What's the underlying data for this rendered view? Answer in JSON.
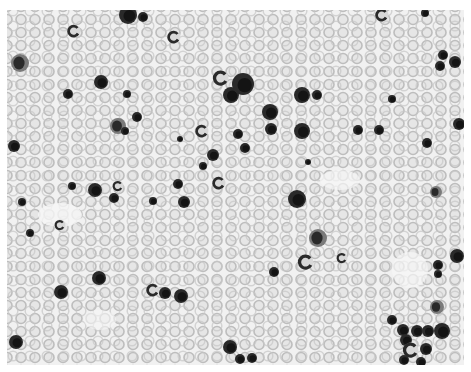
{
  "image": {
    "subject": "blood smear micrograph",
    "palette": {
      "background": "#f1f1f1",
      "rbc_ring": "#bdbdbd",
      "rbc_fill": "#e4e4e4",
      "nucleus": "#2a2a2a",
      "nucleus_dark": "#141414",
      "cytoplasm": "#7a7a7a",
      "border": "#ffffff"
    },
    "nucleated_cells": [
      {
        "x": 128,
        "y": 15,
        "r": 9
      },
      {
        "x": 143,
        "y": 17,
        "r": 5
      },
      {
        "x": 74,
        "y": 31,
        "r": 5,
        "type": "seg"
      },
      {
        "x": 174,
        "y": 37,
        "r": 5,
        "type": "seg"
      },
      {
        "x": 382,
        "y": 15,
        "r": 5,
        "type": "seg"
      },
      {
        "x": 425,
        "y": 13,
        "r": 4
      },
      {
        "x": 20,
        "y": 63,
        "r": 8,
        "type": "mono"
      },
      {
        "x": 101,
        "y": 82,
        "r": 7
      },
      {
        "x": 68,
        "y": 94,
        "r": 5
      },
      {
        "x": 127,
        "y": 94,
        "r": 4
      },
      {
        "x": 137,
        "y": 117,
        "r": 5
      },
      {
        "x": 118,
        "y": 126,
        "r": 7,
        "type": "mono"
      },
      {
        "x": 125,
        "y": 131,
        "r": 4
      },
      {
        "x": 14,
        "y": 146,
        "r": 6
      },
      {
        "x": 180,
        "y": 139,
        "r": 3
      },
      {
        "x": 221,
        "y": 78,
        "r": 6,
        "type": "seg"
      },
      {
        "x": 231,
        "y": 95,
        "r": 8
      },
      {
        "x": 243,
        "y": 84,
        "r": 11
      },
      {
        "x": 270,
        "y": 112,
        "r": 8
      },
      {
        "x": 271,
        "y": 129,
        "r": 6
      },
      {
        "x": 202,
        "y": 131,
        "r": 5,
        "type": "seg"
      },
      {
        "x": 238,
        "y": 134,
        "r": 5
      },
      {
        "x": 245,
        "y": 148,
        "r": 5
      },
      {
        "x": 213,
        "y": 155,
        "r": 6
      },
      {
        "x": 203,
        "y": 166,
        "r": 4
      },
      {
        "x": 302,
        "y": 95,
        "r": 8
      },
      {
        "x": 317,
        "y": 95,
        "r": 5
      },
      {
        "x": 302,
        "y": 131,
        "r": 8
      },
      {
        "x": 308,
        "y": 162,
        "r": 3
      },
      {
        "x": 392,
        "y": 99,
        "r": 4
      },
      {
        "x": 358,
        "y": 130,
        "r": 5
      },
      {
        "x": 379,
        "y": 130,
        "r": 5
      },
      {
        "x": 427,
        "y": 143,
        "r": 5
      },
      {
        "x": 443,
        "y": 55,
        "r": 5
      },
      {
        "x": 440,
        "y": 66,
        "r": 5
      },
      {
        "x": 455,
        "y": 62,
        "r": 6
      },
      {
        "x": 459,
        "y": 124,
        "r": 6
      },
      {
        "x": 219,
        "y": 183,
        "r": 5,
        "type": "seg"
      },
      {
        "x": 178,
        "y": 184,
        "r": 5
      },
      {
        "x": 72,
        "y": 186,
        "r": 4
      },
      {
        "x": 95,
        "y": 190,
        "r": 7
      },
      {
        "x": 118,
        "y": 186,
        "r": 4,
        "type": "seg"
      },
      {
        "x": 114,
        "y": 198,
        "r": 5
      },
      {
        "x": 153,
        "y": 201,
        "r": 4
      },
      {
        "x": 184,
        "y": 202,
        "r": 6
      },
      {
        "x": 297,
        "y": 199,
        "r": 9
      },
      {
        "x": 436,
        "y": 192,
        "r": 5,
        "type": "mono"
      },
      {
        "x": 30,
        "y": 233,
        "r": 4
      },
      {
        "x": 60,
        "y": 225,
        "r": 4,
        "type": "seg"
      },
      {
        "x": 318,
        "y": 238,
        "r": 8,
        "type": "mono"
      },
      {
        "x": 306,
        "y": 262,
        "r": 6,
        "type": "seg"
      },
      {
        "x": 342,
        "y": 258,
        "r": 4,
        "type": "seg"
      },
      {
        "x": 274,
        "y": 272,
        "r": 5
      },
      {
        "x": 99,
        "y": 278,
        "r": 7
      },
      {
        "x": 61,
        "y": 292,
        "r": 7
      },
      {
        "x": 153,
        "y": 290,
        "r": 5,
        "type": "seg"
      },
      {
        "x": 165,
        "y": 293,
        "r": 6
      },
      {
        "x": 181,
        "y": 296,
        "r": 7
      },
      {
        "x": 438,
        "y": 265,
        "r": 5
      },
      {
        "x": 438,
        "y": 274,
        "r": 4
      },
      {
        "x": 457,
        "y": 256,
        "r": 7
      },
      {
        "x": 437,
        "y": 307,
        "r": 6,
        "type": "mono"
      },
      {
        "x": 392,
        "y": 320,
        "r": 5
      },
      {
        "x": 403,
        "y": 330,
        "r": 6
      },
      {
        "x": 417,
        "y": 331,
        "r": 6
      },
      {
        "x": 428,
        "y": 331,
        "r": 6
      },
      {
        "x": 442,
        "y": 331,
        "r": 8
      },
      {
        "x": 406,
        "y": 340,
        "r": 6
      },
      {
        "x": 426,
        "y": 349,
        "r": 6
      },
      {
        "x": 411,
        "y": 350,
        "r": 6,
        "type": "seg"
      },
      {
        "x": 404,
        "y": 360,
        "r": 5
      },
      {
        "x": 421,
        "y": 362,
        "r": 5
      },
      {
        "x": 16,
        "y": 342,
        "r": 7
      },
      {
        "x": 230,
        "y": 347,
        "r": 7
      },
      {
        "x": 240,
        "y": 359,
        "r": 5
      },
      {
        "x": 252,
        "y": 358,
        "r": 5
      },
      {
        "x": 22,
        "y": 202,
        "r": 4
      }
    ]
  }
}
